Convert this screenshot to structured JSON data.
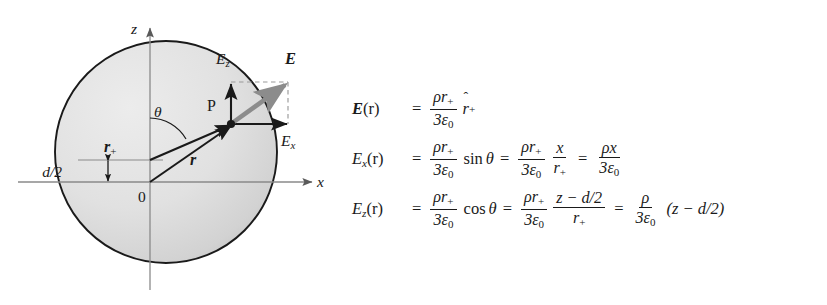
{
  "figure": {
    "diagram": {
      "name": "charged-sphere-field-decomposition",
      "axes": {
        "z_label": "z",
        "x_label": "x",
        "origin_label": "0"
      },
      "labels": {
        "point": "P",
        "theta": "θ",
        "offset": "d/2",
        "vector_r": "r",
        "vector_r_plus": "r",
        "vector_r_plus_sub": "+",
        "field_E": "E",
        "field_Ez": "E",
        "field_Ez_sub": "z",
        "field_Ex": "E",
        "field_Ex_sub": "x"
      },
      "colors": {
        "sphere_fill_light": "#e3e3e3",
        "sphere_fill_dark": "#c9c9c9",
        "sphere_stroke": "#1a1a1a",
        "axis": "#8a8a8a",
        "vector": "#1a1a1a",
        "field_arrow": "#8c8c8c",
        "dashed": "#9a9a9a"
      }
    },
    "equations": [
      {
        "name": "field-vector-equation",
        "lhs_symbol": "E",
        "lhs_arg": "(r)",
        "numerator": "ρr",
        "numerator_sub": "+",
        "denominator_coeff": "3ε",
        "denominator_sub": "0",
        "tail_symbol": "r",
        "tail_sub": "+",
        "tail_hat": "ˆ"
      },
      {
        "name": "field-x-component-equation",
        "lhs_symbol": "E",
        "lhs_sub": "x",
        "lhs_arg": "(r)",
        "numerator": "ρr",
        "numerator_sub": "+",
        "denominator_coeff": "3ε",
        "denominator_sub": "0",
        "trig": "sin",
        "trig_arg": "θ",
        "num2": "x",
        "den2": "r",
        "den2_sub": "+",
        "final_num": "ρx",
        "final_den_coeff": "3ε",
        "final_den_sub": "0"
      },
      {
        "name": "field-z-component-equation",
        "lhs_symbol": "E",
        "lhs_sub": "z",
        "lhs_arg": "(r)",
        "numerator": "ρr",
        "numerator_sub": "+",
        "denominator_coeff": "3ε",
        "denominator_sub": "0",
        "trig": "cos",
        "trig_arg": "θ",
        "num2": "z − d/2",
        "den2": "r",
        "den2_sub": "+",
        "final_num": "ρ",
        "final_den_coeff": "3ε",
        "final_den_sub": "0",
        "final_tail": "(z − d/2)"
      }
    ]
  }
}
